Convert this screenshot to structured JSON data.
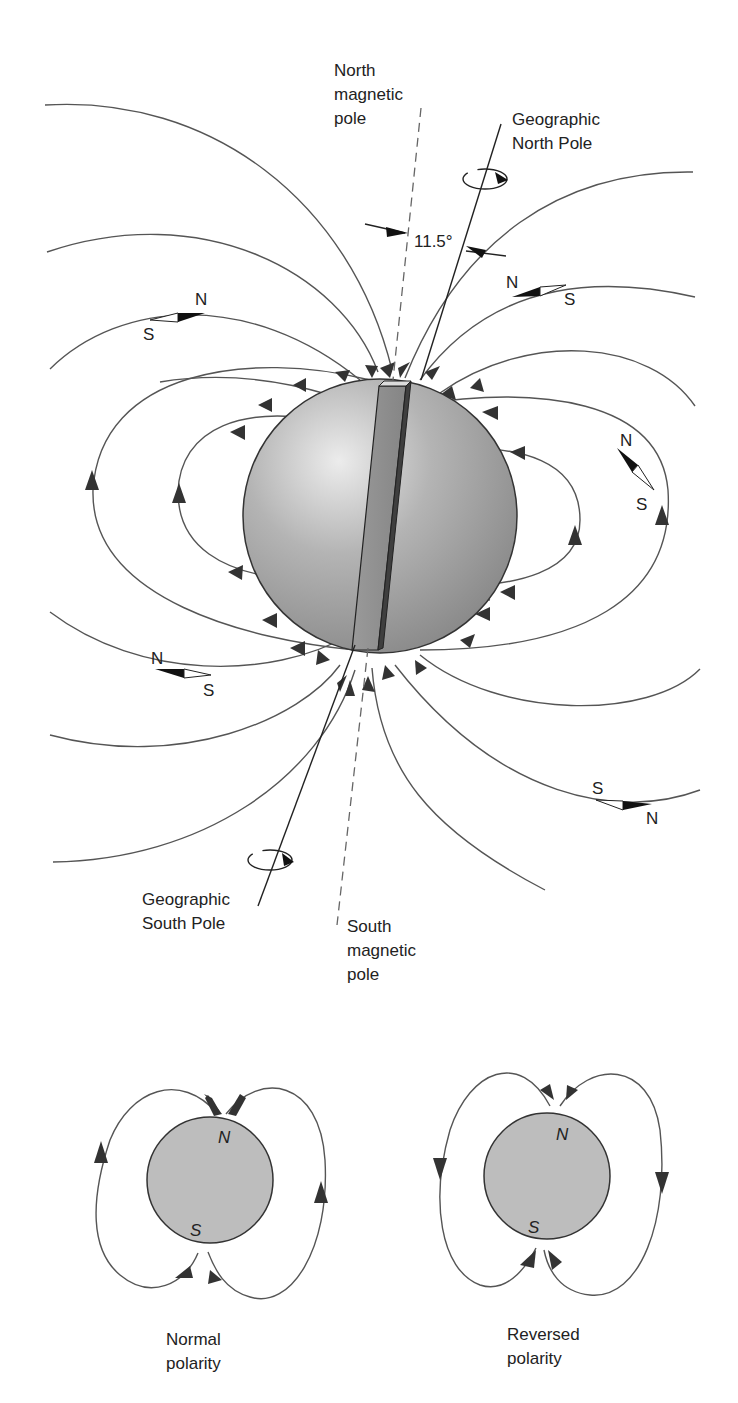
{
  "main_diagram": {
    "labels": {
      "north_magnetic_pole": [
        "North",
        "magnetic",
        "pole"
      ],
      "geographic_north_pole": [
        "Geographic",
        "North Pole"
      ],
      "angle": "11.5°",
      "geographic_south_pole": [
        "Geographic",
        "South Pole"
      ],
      "south_magnetic_pole": [
        "South",
        "magnetic",
        "pole"
      ]
    },
    "compass_needles": [
      {
        "position": "upper-left",
        "n": "N",
        "s": "S"
      },
      {
        "position": "upper-right",
        "n": "N",
        "s": "S"
      },
      {
        "position": "right",
        "n": "N",
        "s": "S"
      },
      {
        "position": "lower-left",
        "n": "N",
        "s": "S"
      },
      {
        "position": "lower-right",
        "n": "N",
        "s": "S"
      }
    ],
    "colors": {
      "earth_light": "#e6e6e6",
      "earth_dark": "#8c8c8c",
      "bar_magnet": "#8a8a8a",
      "field_line": "#555555"
    }
  },
  "polarity_diagrams": [
    {
      "north": "N",
      "south": "S",
      "caption": [
        "Normal",
        "polarity"
      ]
    },
    {
      "north": "N",
      "south": "S",
      "caption": [
        "Reversed",
        "polarity"
      ]
    }
  ]
}
